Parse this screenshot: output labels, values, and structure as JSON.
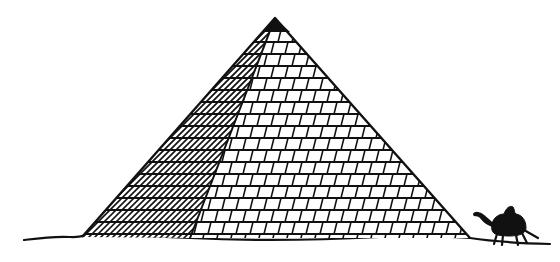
{
  "image": {
    "subject": "Pyramid drawing with camel",
    "elements": [
      "pyramid",
      "camel",
      "ground-line"
    ],
    "colors": {
      "ink": "#111111",
      "background": "#ffffff"
    }
  }
}
